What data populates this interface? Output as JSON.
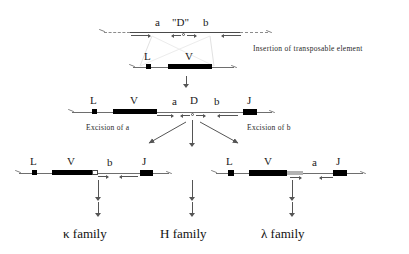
{
  "diagram": {
    "captions": {
      "insertion": "Insertion of transposable element",
      "excision_a": "Excision of a",
      "excision_b": "Excision of b"
    },
    "rows": [
      {
        "id": "transposable-element",
        "name": "transposable element",
        "segments": [
          {
            "label": "a",
            "kind": "spacer"
          },
          {
            "label": "\"D\"",
            "kind": "d-element"
          },
          {
            "label": "b",
            "kind": "spacer"
          }
        ]
      },
      {
        "id": "germline-lv",
        "name": "germline L V segment",
        "segments": [
          {
            "label": "L",
            "kind": "leader-exon"
          },
          {
            "label": "V",
            "kind": "v-exon"
          }
        ]
      },
      {
        "id": "inserted-lvadbj",
        "name": "L V a D b J after insertion",
        "segments": [
          {
            "label": "L",
            "kind": "leader-exon"
          },
          {
            "label": "V",
            "kind": "v-exon"
          },
          {
            "label": "a",
            "kind": "spacer"
          },
          {
            "label": "D",
            "kind": "d-element"
          },
          {
            "label": "b",
            "kind": "spacer"
          },
          {
            "label": "J",
            "kind": "j-exon"
          }
        ]
      },
      {
        "id": "kappa-product",
        "name": "kappa product L V b J",
        "segments": [
          {
            "label": "L",
            "kind": "leader-exon"
          },
          {
            "label": "V",
            "kind": "v-exon"
          },
          {
            "label": "b",
            "kind": "spacer"
          },
          {
            "label": "J",
            "kind": "j-exon"
          }
        ]
      },
      {
        "id": "lambda-product",
        "name": "lambda product L V a J",
        "segments": [
          {
            "label": "L",
            "kind": "leader-exon"
          },
          {
            "label": "V",
            "kind": "v-exon"
          },
          {
            "label": "a",
            "kind": "spacer"
          },
          {
            "label": "J",
            "kind": "j-exon"
          }
        ]
      }
    ],
    "outcomes": [
      {
        "id": "kappa",
        "label": "κ family",
        "symbol": "κ"
      },
      {
        "id": "heavy",
        "label": "H family",
        "symbol": "H"
      },
      {
        "id": "lambda",
        "label": "λ family",
        "symbol": "λ"
      }
    ],
    "labels": {
      "r1_a": "a",
      "r1_d": "\"D\"",
      "r1_b": "b",
      "r2_L": "L",
      "r2_V": "V",
      "r3_L": "L",
      "r3_V": "V",
      "r3_a": "a",
      "r3_D": "D",
      "r3_b": "b",
      "r3_J": "J",
      "r4_L": "L",
      "r4_V": "V",
      "r4_b": "b",
      "r4_J": "J",
      "r5_L": "L",
      "r5_V": "V",
      "r5_a": "a",
      "r5_J": "J"
    },
    "colors": {
      "exon_fill": "#000000",
      "gray_fill": "#b3b3b3",
      "line": "#6e6e6e",
      "text": "#111111"
    }
  }
}
